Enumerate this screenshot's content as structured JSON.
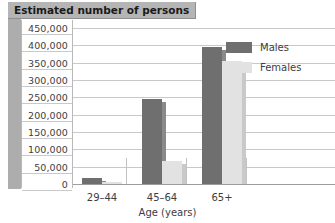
{
  "title": {
    "text": "Estimated number of persons"
  },
  "legend": {
    "position": "inside-top-right",
    "entries": [
      {
        "label": "Males",
        "color": "#6f6f6f",
        "icon": "legend-swatch-icon"
      },
      {
        "label": "Females",
        "color": "#e2e2e2",
        "icon": "legend-swatch-icon"
      }
    ]
  },
  "yaxis": {
    "ticks": [
      "450,000",
      "400,000",
      "350,000",
      "300,000",
      "250,000",
      "200,000",
      "150,000",
      "100,000",
      "50,000",
      "0"
    ],
    "min": 0,
    "max": 450000,
    "step": 50000
  },
  "xaxis": {
    "title": "Age (years)",
    "categories": [
      "29–44",
      "45–64",
      "65+"
    ]
  },
  "chart_data": {
    "type": "bar",
    "title": "Estimated number of persons",
    "xlabel": "Age (years)",
    "ylabel": "Estimated number of persons",
    "categories": [
      "29–44",
      "45–64",
      "65+"
    ],
    "series": [
      {
        "name": "Males",
        "color": "#6f6f6f",
        "values": [
          18000,
          245000,
          395000
        ]
      },
      {
        "name": "Females",
        "color": "#e2e2e2",
        "values": [
          5000,
          65000,
          355000
        ]
      }
    ],
    "ylim": [
      0,
      450000
    ],
    "ytick_step": 50000,
    "ytick_labels": [
      "0",
      "50,000",
      "100,000",
      "150,000",
      "200,000",
      "250,000",
      "300,000",
      "350,000",
      "400,000",
      "450,000"
    ],
    "grid": true,
    "grid_axis": "y",
    "legend_position": "inside top right",
    "orientation": "vertical",
    "grouped": true
  }
}
